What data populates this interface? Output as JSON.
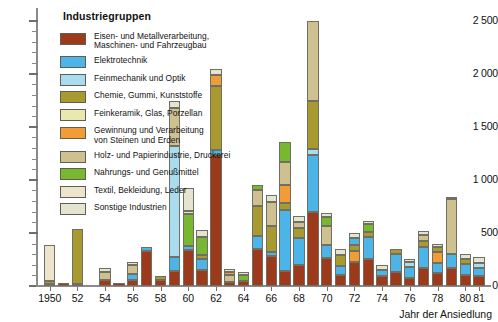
{
  "axis": {
    "y_ticks_major": [
      "0",
      "500",
      "1 000",
      "1 500",
      "2 000",
      "2 500"
    ],
    "x_title": "Jahr der Ansiedlung",
    "x_tick_labels": [
      "1950",
      "52",
      "54",
      "56",
      "58",
      "60",
      "62",
      "64",
      "66",
      "68",
      "70",
      "72",
      "74",
      "76",
      "78",
      "80",
      "81"
    ]
  },
  "legend": {
    "title": "Industriegruppen",
    "items": [
      {
        "label": "Eisen- und Metallverarbeitung,\nMaschinen- und Fahrzeugbau",
        "color": "#9e3a1c"
      },
      {
        "label": "Elektrotechnik",
        "color": "#4cb4e7"
      },
      {
        "label": "Feinmechanik und Optik",
        "color": "#aadcf0"
      },
      {
        "label": "Chemie, Gummi, Kunststoffe",
        "color": "#a89a2e"
      },
      {
        "label": "Feinkeramik, Glas, Porzellan",
        "color": "#e8e8b0"
      },
      {
        "label": "Gewinnung und Verarbeitung\nvon Steinen und Erden",
        "color": "#f29c38"
      },
      {
        "label": "Holz- und Papierindustrie, Druckerei",
        "color": "#cfc090"
      },
      {
        "label": "Nahrungs- und Genußmittel",
        "color": "#78b830"
      },
      {
        "label": "Textil, Bekleidung, Leder",
        "color": "#ece4cc"
      },
      {
        "label": "Sonstige Industrien",
        "color": "#e4e4d0"
      }
    ]
  },
  "chart_data": {
    "type": "bar",
    "subtype": "stacked-vertical",
    "title": "",
    "xlabel": "Jahr der Ansiedlung",
    "ylabel": "",
    "ylim": [
      0,
      2600
    ],
    "y_major_step": 500,
    "y_minor_step": 100,
    "grid": false,
    "legend_position": "inside-top-left",
    "series": [
      {
        "name": "Eisen- und Metallverarbeitung, Maschinen- und Fahrzeugbau",
        "color": "#9e3a1c",
        "values": [
          15,
          25,
          20,
          0,
          55,
          30,
          180,
          330,
          340,
          1230,
          85,
          150,
          350,
          620,
          700,
          210,
          100,
          280,
          250,
          120,
          170,
          130
        ]
      },
      {
        "name": "Elektrotechnik",
        "color": "#4cb4e7",
        "values": [
          0,
          0,
          0,
          0,
          0,
          0,
          120,
          35,
          130,
          40,
          0,
          55,
          580,
          530,
          250,
          130,
          200,
          570,
          30,
          300,
          110,
          180
        ]
      },
      {
        "name": "Feinmechanik und Optik",
        "color": "#aadcf0",
        "values": [
          0,
          0,
          0,
          0,
          0,
          0,
          0,
          0,
          1050,
          35,
          0,
          470,
          0,
          0,
          60,
          0,
          0,
          0,
          90,
          0,
          0,
          0
        ]
      },
      {
        "name": "Chemie, Gummi, Kunststoffe",
        "color": "#a89a2e",
        "values": [
          30,
          0,
          520,
          0,
          0,
          0,
          30,
          0,
          170,
          490,
          0,
          40,
          60,
          0,
          95,
          340,
          100,
          170,
          45,
          50,
          40,
          60
        ]
      },
      {
        "name": "Feinkeramik, Glas, Porzellan",
        "color": "#e8e8b0",
        "values": [
          0,
          0,
          0,
          0,
          0,
          0,
          0,
          0,
          0,
          25,
          0,
          0,
          0,
          0,
          0,
          0,
          0,
          0,
          0,
          0,
          0,
          0
        ]
      },
      {
        "name": "Gewinnung und Verarbeitung von Steinen und Erden",
        "color": "#f29c38",
        "values": [
          0,
          0,
          0,
          0,
          0,
          0,
          0,
          0,
          0,
          100,
          70,
          0,
          0,
          170,
          0,
          0,
          0,
          0,
          100,
          0,
          0,
          0
        ]
      },
      {
        "name": "Holz- und Papierindustrie, Druckerei",
        "color": "#cfc090",
        "values": [
          0,
          0,
          0,
          0,
          75,
          0,
          85,
          0,
          175,
          0,
          65,
          95,
          90,
          215,
          1060,
          150,
          180,
          40,
          0,
          0,
          520,
          0
        ]
      },
      {
        "name": "Nahrungs- und Genußmittel",
        "color": "#78b830",
        "values": [
          0,
          0,
          0,
          0,
          0,
          0,
          0,
          0,
          0,
          0,
          55,
          175,
          50,
          195,
          0,
          0,
          0,
          65,
          80,
          0,
          0,
          0
        ]
      },
      {
        "name": "Textil, Bekleidung, Leder",
        "color": "#ece4cc",
        "values": [
          340,
          0,
          0,
          0,
          0,
          0,
          0,
          0,
          0,
          0,
          0,
          0,
          0,
          0,
          0,
          0,
          0,
          0,
          0,
          0,
          0,
          0
        ]
      },
      {
        "name": "Sonstige Industrien",
        "color": "#e4e4d0",
        "values": [
          0,
          0,
          0,
          0,
          40,
          0,
          30,
          0,
          60,
          50,
          30,
          30,
          60,
          70,
          50,
          60,
          30,
          60,
          50,
          45,
          50,
          50
        ]
      }
    ],
    "bars": [
      {
        "year": "1950",
        "total": 385,
        "segments": [
          {
            "s": 0,
            "v": 15
          },
          {
            "s": 3,
            "v": 30
          },
          {
            "s": 8,
            "v": 340
          }
        ]
      },
      {
        "year": "1951",
        "total": 25,
        "segments": [
          {
            "s": 0,
            "v": 25
          }
        ]
      },
      {
        "year": "1952",
        "total": 540,
        "segments": [
          {
            "s": 0,
            "v": 20
          },
          {
            "s": 3,
            "v": 520
          }
        ]
      },
      {
        "year": "1953",
        "total": 0,
        "segments": []
      },
      {
        "year": "1954",
        "total": 170,
        "segments": [
          {
            "s": 0,
            "v": 55
          },
          {
            "s": 6,
            "v": 75
          },
          {
            "s": 9,
            "v": 40
          }
        ]
      },
      {
        "year": "1955",
        "total": 30,
        "segments": [
          {
            "s": 0,
            "v": 30
          }
        ]
      },
      {
        "year": "1956",
        "total": 225,
        "segments": [
          {
            "s": 0,
            "v": 60
          },
          {
            "s": 2,
            "v": 0
          },
          {
            "s": 1,
            "v": 50
          },
          {
            "s": 6,
            "v": 85
          },
          {
            "s": 9,
            "v": 30
          }
        ]
      },
      {
        "year": "1957",
        "total": 365,
        "segments": [
          {
            "s": 0,
            "v": 330
          },
          {
            "s": 1,
            "v": 35
          }
        ]
      },
      {
        "year": "1958",
        "total": 90,
        "segments": [
          {
            "s": 0,
            "v": 60
          },
          {
            "s": 3,
            "v": 30
          }
        ]
      },
      {
        "year": "1959",
        "total": 1745,
        "segments": [
          {
            "s": 0,
            "v": 140
          },
          {
            "s": 1,
            "v": 130
          },
          {
            "s": 2,
            "v": 1050
          },
          {
            "s": 6,
            "v": 360
          },
          {
            "s": 9,
            "v": 65
          }
        ]
      },
      {
        "year": "1960",
        "total": 920,
        "segments": [
          {
            "s": 0,
            "v": 340
          },
          {
            "s": 1,
            "v": 40
          },
          {
            "s": 7,
            "v": 300
          },
          {
            "s": 4,
            "v": 25
          },
          {
            "s": 9,
            "v": 215
          }
        ]
      },
      {
        "year": "1961",
        "total": 530,
        "segments": [
          {
            "s": 0,
            "v": 150
          },
          {
            "s": 1,
            "v": 100
          },
          {
            "s": 3,
            "v": 40
          },
          {
            "s": 7,
            "v": 170
          },
          {
            "s": 9,
            "v": 70
          }
        ]
      },
      {
        "year": "1962",
        "total": 2040,
        "segments": [
          {
            "s": 0,
            "v": 1230
          },
          {
            "s": 1,
            "v": 55
          },
          {
            "s": 3,
            "v": 600
          },
          {
            "s": 5,
            "v": 100
          },
          {
            "s": 9,
            "v": 55
          }
        ]
      },
      {
        "year": "1963",
        "total": 165,
        "segments": [
          {
            "s": 0,
            "v": 40
          },
          {
            "s": 6,
            "v": 65
          },
          {
            "s": 5,
            "v": 30
          },
          {
            "s": 9,
            "v": 30
          }
        ]
      },
      {
        "year": "1964",
        "total": 130,
        "segments": [
          {
            "s": 0,
            "v": 50
          },
          {
            "s": 7,
            "v": 55
          },
          {
            "s": 9,
            "v": 25
          }
        ]
      },
      {
        "year": "1965",
        "total": 950,
        "segments": [
          {
            "s": 0,
            "v": 350
          },
          {
            "s": 1,
            "v": 120
          },
          {
            "s": 3,
            "v": 280
          },
          {
            "s": 6,
            "v": 150
          },
          {
            "s": 7,
            "v": 50
          }
        ]
      },
      {
        "year": "1966",
        "total": 860,
        "segments": [
          {
            "s": 0,
            "v": 280
          },
          {
            "s": 2,
            "v": 0
          },
          {
            "s": 1,
            "v": 40
          },
          {
            "s": 3,
            "v": 250
          },
          {
            "s": 6,
            "v": 220
          },
          {
            "s": 9,
            "v": 70
          }
        ]
      },
      {
        "year": "1967",
        "total": 1640,
        "segments": [
          {
            "s": 0,
            "v": 140
          },
          {
            "s": 1,
            "v": 580
          },
          {
            "s": 3,
            "v": 60
          },
          {
            "s": 5,
            "v": 170
          },
          {
            "s": 6,
            "v": 215
          },
          {
            "s": 7,
            "v": 195
          }
        ]
      },
      {
        "year": "1968",
        "total": 660,
        "segments": [
          {
            "s": 0,
            "v": 200
          },
          {
            "s": 1,
            "v": 250
          },
          {
            "s": 3,
            "v": 95
          },
          {
            "s": 6,
            "v": 60
          },
          {
            "s": 9,
            "v": 55
          }
        ]
      },
      {
        "year": "1969",
        "total": 2500,
        "segments": [
          {
            "s": 0,
            "v": 700
          },
          {
            "s": 1,
            "v": 530
          },
          {
            "s": 2,
            "v": 60
          },
          {
            "s": 3,
            "v": 450
          },
          {
            "s": 6,
            "v": 760
          }
        ]
      },
      {
        "year": "1970",
        "total": 690,
        "segments": [
          {
            "s": 0,
            "v": 260
          },
          {
            "s": 1,
            "v": 130
          },
          {
            "s": 6,
            "v": 180
          },
          {
            "s": 7,
            "v": 80
          },
          {
            "s": 9,
            "v": 40
          }
        ]
      },
      {
        "year": "1971",
        "total": 350,
        "segments": [
          {
            "s": 0,
            "v": 100
          },
          {
            "s": 1,
            "v": 90
          },
          {
            "s": 3,
            "v": 100
          },
          {
            "s": 9,
            "v": 60
          }
        ]
      },
      {
        "year": "1972",
        "total": 500,
        "segments": [
          {
            "s": 0,
            "v": 230
          },
          {
            "s": 5,
            "v": 100
          },
          {
            "s": 3,
            "v": 60
          },
          {
            "s": 1,
            "v": 60
          },
          {
            "s": 9,
            "v": 50
          }
        ]
      },
      {
        "year": "1973",
        "total": 610,
        "segments": [
          {
            "s": 0,
            "v": 250
          },
          {
            "s": 1,
            "v": 210
          },
          {
            "s": 3,
            "v": 45
          },
          {
            "s": 7,
            "v": 80
          },
          {
            "s": 9,
            "v": 25
          }
        ]
      },
      {
        "year": "1974",
        "total": 200,
        "segments": [
          {
            "s": 0,
            "v": 90
          },
          {
            "s": 1,
            "v": 60
          },
          {
            "s": 9,
            "v": 50
          }
        ]
      },
      {
        "year": "1975",
        "total": 350,
        "segments": [
          {
            "s": 0,
            "v": 130
          },
          {
            "s": 1,
            "v": 170
          },
          {
            "s": 3,
            "v": 50
          }
        ]
      },
      {
        "year": "1976",
        "total": 255,
        "segments": [
          {
            "s": 0,
            "v": 80
          },
          {
            "s": 1,
            "v": 100
          },
          {
            "s": 2,
            "v": 45
          },
          {
            "s": 9,
            "v": 30
          }
        ]
      },
      {
        "year": "1977",
        "total": 520,
        "segments": [
          {
            "s": 0,
            "v": 170
          },
          {
            "s": 1,
            "v": 200
          },
          {
            "s": 3,
            "v": 50
          },
          {
            "s": 6,
            "v": 60
          },
          {
            "s": 9,
            "v": 40
          }
        ]
      },
      {
        "year": "1978",
        "total": 400,
        "segments": [
          {
            "s": 0,
            "v": 120
          },
          {
            "s": 1,
            "v": 100
          },
          {
            "s": 5,
            "v": 100
          },
          {
            "s": 3,
            "v": 50
          },
          {
            "s": 9,
            "v": 30
          }
        ]
      },
      {
        "year": "1979",
        "total": 840,
        "segments": [
          {
            "s": 0,
            "v": 170
          },
          {
            "s": 1,
            "v": 130
          },
          {
            "s": 6,
            "v": 520
          },
          {
            "s": 9,
            "v": 20
          }
        ]
      },
      {
        "year": "1980",
        "total": 300,
        "segments": [
          {
            "s": 0,
            "v": 100
          },
          {
            "s": 1,
            "v": 110
          },
          {
            "s": 3,
            "v": 40
          },
          {
            "s": 9,
            "v": 50
          }
        ]
      },
      {
        "year": "1981",
        "total": 270,
        "segments": [
          {
            "s": 0,
            "v": 90
          },
          {
            "s": 1,
            "v": 80
          },
          {
            "s": 2,
            "v": 45
          },
          {
            "s": 9,
            "v": 55
          }
        ]
      }
    ]
  }
}
